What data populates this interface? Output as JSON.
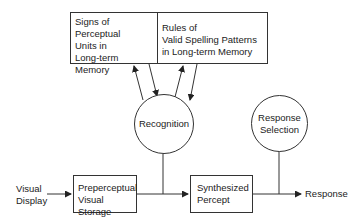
{
  "diagram": {
    "memory_boxes": [
      {
        "id": "signs",
        "lines": [
          "Signs of",
          "Perceptual",
          "Units in",
          "Long-term Memory"
        ]
      },
      {
        "id": "rules",
        "lines": [
          "Rules of",
          "Valid Spelling Patterns",
          "in Long-term Memory"
        ]
      }
    ],
    "nodes": {
      "recognition": "Recognition",
      "response_selection": [
        "Response",
        "Selection"
      ],
      "preperceptual": [
        "Preperceptual",
        "Visual Storage"
      ],
      "synthesized": [
        "Synthesized",
        "Percept"
      ]
    },
    "input_label": [
      "Visual",
      "Display"
    ],
    "output_label": "Response",
    "colors": {
      "line": "#333333",
      "background": "#ffffff"
    }
  }
}
